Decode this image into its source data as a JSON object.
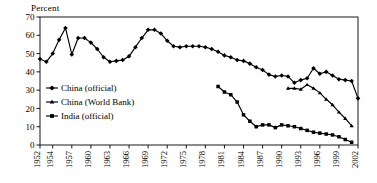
{
  "chart_data": {
    "type": "line",
    "title": "",
    "subtitle": "",
    "xlabel": "",
    "ylabel": "Percent",
    "ylim": [
      0,
      70
    ],
    "xlim": [
      1952,
      2002
    ],
    "ytick_step": 10,
    "yticks": [
      "0",
      "10",
      "20",
      "30",
      "40",
      "50",
      "60",
      "70"
    ],
    "xticks": [
      "1952",
      "1954",
      "1957",
      "1960",
      "1963",
      "1966",
      "1969",
      "1972",
      "1975",
      "1978",
      "1981",
      "1984",
      "1987",
      "1990",
      "1993",
      "1996",
      "1999",
      "2002"
    ],
    "grid": false,
    "legend_position": "inside-left",
    "series": [
      {
        "name": "China (official)",
        "marker": "diamond",
        "x": [
          1952,
          1953,
          1954,
          1955,
          1956,
          1957,
          1958,
          1959,
          1960,
          1961,
          1962,
          1963,
          1964,
          1965,
          1966,
          1967,
          1968,
          1969,
          1970,
          1971,
          1972,
          1973,
          1974,
          1975,
          1976,
          1977,
          1978,
          1979,
          1980,
          1981,
          1982,
          1983,
          1984,
          1985,
          1986,
          1987,
          1988,
          1989,
          1990,
          1991,
          1992,
          1993,
          1994,
          1995,
          1996,
          1997,
          1998,
          1999,
          2000,
          2001,
          2002
        ],
        "y": [
          47,
          45.5,
          50,
          57.5,
          64,
          49.5,
          58.5,
          58.5,
          56,
          52.5,
          48,
          45.5,
          46,
          46.5,
          48.5,
          53.5,
          58.5,
          63,
          63,
          61,
          57,
          54,
          53.5,
          54,
          54,
          54,
          53.5,
          52.5,
          51,
          49,
          48,
          46.5,
          46,
          44.5,
          42.5,
          41,
          38.5,
          37.5,
          38,
          37.5,
          34,
          35.5,
          36.5,
          42,
          39,
          40,
          38,
          36,
          35.5,
          35,
          25.5
        ]
      },
      {
        "name": "China (World Bank)",
        "marker": "triangle",
        "x": [
          1991,
          1992,
          1993,
          1994,
          1995,
          1996,
          1997,
          1998,
          1999,
          2000,
          2001
        ],
        "y": [
          31,
          31,
          30.5,
          33,
          31,
          28.5,
          25,
          22,
          18,
          14.5,
          10.5
        ]
      },
      {
        "name": "India (official)",
        "marker": "square",
        "x": [
          1980,
          1981,
          1982,
          1983,
          1984,
          1985,
          1986,
          1987,
          1988,
          1989,
          1990,
          1991,
          1992,
          1993,
          1994,
          1995,
          1996,
          1997,
          1998,
          1999,
          2000,
          2001
        ],
        "y": [
          32,
          29,
          27.5,
          23.5,
          16.5,
          13,
          10,
          11,
          11,
          9.5,
          11,
          10.5,
          10,
          9,
          8,
          7,
          6.5,
          6,
          5.5,
          4.5,
          3,
          1.5
        ]
      }
    ]
  },
  "legend": {
    "items": [
      {
        "label": "China (official)",
        "marker": "diamond"
      },
      {
        "label": "China (World Bank)",
        "marker": "triangle"
      },
      {
        "label": "India (official)",
        "marker": "square"
      }
    ]
  }
}
